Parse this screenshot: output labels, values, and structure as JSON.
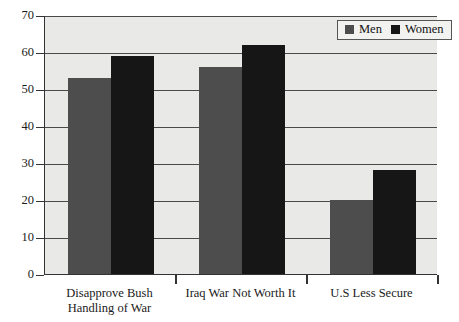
{
  "chart_data": {
    "type": "bar",
    "title": "",
    "subtitle": "",
    "xlabel": "",
    "ylabel": "",
    "ylim": [
      0,
      70
    ],
    "yticks": [
      0,
      10,
      20,
      30,
      40,
      50,
      60,
      70
    ],
    "ytick_labels": [
      "0",
      "10",
      "20",
      "30",
      "40",
      "50",
      "60",
      "70"
    ],
    "grid": true,
    "legend_position": "top-right",
    "categories": [
      "Disapprove Bush\nHandling of War",
      "Iraq War Not Worth It",
      "U.S Less Secure"
    ],
    "series": [
      {
        "name": "Men",
        "color": "#4d4d4d",
        "values": [
          53,
          56,
          20
        ]
      },
      {
        "name": "Women",
        "color": "#161616",
        "values": [
          59,
          62,
          28
        ]
      }
    ]
  },
  "legend": {
    "entries": [
      {
        "label": "Men",
        "swatch": "men-swatch"
      },
      {
        "label": "Women",
        "swatch": "women-swatch"
      }
    ]
  },
  "colors": {
    "plot_background": "#e9e9e7",
    "page_background": "#ffffff",
    "axis": "#333333",
    "gridline": "#4a4a4a",
    "men": "#4d4d4d",
    "women": "#161616"
  }
}
